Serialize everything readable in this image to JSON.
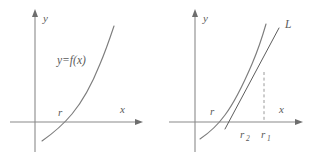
{
  "figure": {
    "panel_count": 2,
    "stroke_color": "#7d7d7d",
    "axis_color": "#8a8a8a",
    "text_color": "#5a5a5a",
    "dash_color": "#9a9a9a",
    "background": "#ffffff"
  },
  "panels": [
    {
      "id": "left",
      "name": "function-graph",
      "axes": {
        "y_label": "y",
        "x_label": "x",
        "origin": {
          "x": 35,
          "y": 122
        },
        "x_axis_end": 140,
        "y_axis_top": 14
      },
      "labels": {
        "function": "y=f(x)",
        "root": "r"
      },
      "curve": {
        "name": "f-curve",
        "description": "increasing convex curve crossing x-axis at r"
      }
    },
    {
      "id": "right",
      "name": "newton-iteration-graph",
      "axes": {
        "y_label": "y",
        "x_label": "x",
        "origin": {
          "x": 38,
          "y": 122
        },
        "x_axis_end": 143,
        "y_axis_top": 14
      },
      "labels": {
        "root": "r",
        "tangent_line": "L",
        "approx_second": "r",
        "approx_second_sub": "2",
        "approx_first": "r",
        "approx_first_sub": "1"
      },
      "curve": {
        "name": "f-curve",
        "description": "increasing convex curve crossing x-axis at r"
      },
      "tangent": {
        "name": "tangent-line-L",
        "description": "tangent to curve at x = r1, meeting x-axis at r2"
      },
      "drop_line": {
        "name": "dashed-drop-line",
        "description": "vertical dashed segment from curve point down to r1 on x-axis"
      }
    }
  ]
}
